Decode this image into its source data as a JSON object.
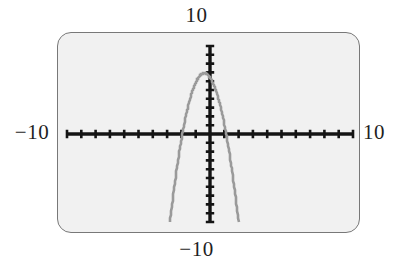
{
  "screen": {
    "device": "graphing-calculator-screen",
    "background_color": "#f1f1f1",
    "border_color": "#787878"
  },
  "labels": {
    "top": "10",
    "bottom": "−10",
    "left": "−10",
    "right": "10"
  },
  "chart_data": {
    "type": "line",
    "title": "",
    "xlabel": "",
    "ylabel": "",
    "xlim": [
      -10,
      10
    ],
    "ylim": [
      -10,
      10
    ],
    "xtick_labels": [
      "−10",
      "10"
    ],
    "ytick_labels": [
      "−10",
      "10"
    ],
    "xtick_step": 1,
    "ytick_step": 1,
    "grid": false,
    "legend": null,
    "axis_color": "#141414",
    "curve_color": "#9a9a9a",
    "series": [
      {
        "name": "parabola",
        "comment": "downward-opening parabola, vertex slightly left of the y-axis near the top of the window",
        "vertex": [
          -0.4,
          6.9
        ],
        "x": [
          -2.8,
          -2.6,
          -2.4,
          -2.2,
          -2.0,
          -1.8,
          -1.6,
          -1.4,
          -1.2,
          -1.0,
          -0.8,
          -0.6,
          -0.4,
          -0.2,
          0.0,
          0.2,
          0.4,
          0.6,
          0.8,
          1.0,
          1.2,
          1.4,
          1.6,
          1.8,
          2.0
        ],
        "values": [
          -10.0,
          -7.7,
          -5.6,
          -3.7,
          -2.0,
          -0.5,
          0.8,
          2.0,
          3.0,
          3.8,
          4.4,
          4.85,
          5.0,
          4.85,
          4.4,
          3.8,
          3.0,
          2.0,
          0.8,
          -0.5,
          -2.0,
          -3.7,
          -5.6,
          -7.7,
          -10.0
        ]
      }
    ]
  }
}
